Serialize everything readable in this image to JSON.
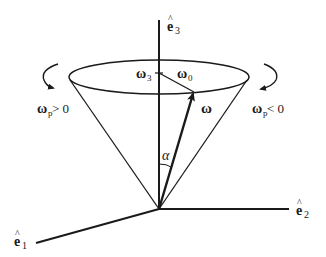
{
  "diagram": {
    "axes": {
      "e3": {
        "base": "e",
        "hat": "^",
        "sub": "3"
      },
      "e2": {
        "base": "e",
        "hat": "^",
        "sub": "2"
      },
      "e1": {
        "base": "e",
        "hat": "^",
        "sub": "1"
      }
    },
    "labels": {
      "omega3": {
        "base": "ω",
        "sub": "3"
      },
      "omega0": {
        "base": "ω",
        "sub": "0"
      },
      "omega": {
        "base": "ω"
      },
      "alpha": "α",
      "precession_positive": {
        "base": "ω",
        "sub": "p",
        "rel": " > 0"
      },
      "precession_negative": {
        "base": "ω",
        "sub": "p",
        "rel": " < 0"
      }
    },
    "colors": {
      "ink": "#1a1a1a",
      "background": "#ffffff"
    }
  }
}
